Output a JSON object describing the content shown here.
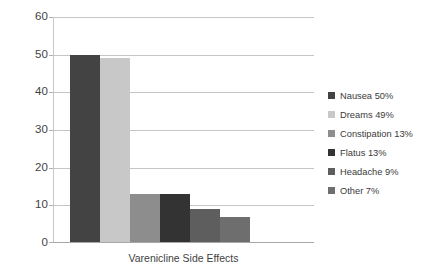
{
  "chart_data": {
    "type": "bar",
    "title": "",
    "xlabel": "Varenicline Side Effects",
    "ylabel": "",
    "categories": [
      "Nausea",
      "Dreams",
      "Constipation",
      "Flatus",
      "Headache",
      "Other"
    ],
    "values": [
      50,
      49,
      13,
      13,
      9,
      7
    ],
    "ylim": [
      0,
      60
    ],
    "y_ticks": [
      "0",
      "10",
      "20",
      "30",
      "40",
      "50",
      "60"
    ],
    "y_tick_values": [
      0,
      10,
      20,
      30,
      40,
      50,
      60
    ],
    "grid": true,
    "legend_position": "right",
    "series": [
      {
        "name": "Varenicline Side Effects",
        "values": [
          50,
          49,
          13,
          13,
          9,
          7
        ]
      }
    ],
    "legend": [
      {
        "label": "Nausea 50%",
        "color": "#434343",
        "value": 50
      },
      {
        "label": "Dreams 49%",
        "color": "#c8c8c8",
        "value": 49
      },
      {
        "label": "Constipation 13%",
        "color": "#8d8d8d",
        "value": 13
      },
      {
        "label": "Flatus 13%",
        "color": "#333333",
        "value": 13
      },
      {
        "label": "Headache 9%",
        "color": "#5e5e5e",
        "value": 9
      },
      {
        "label": "Other 7%",
        "color": "#6e6e6e",
        "value": 7
      }
    ],
    "colors": {
      "gridline": "#c5c5c5",
      "axis": "#a8a8a8",
      "background": "#ffffff",
      "text": "#3f3f3f"
    }
  }
}
